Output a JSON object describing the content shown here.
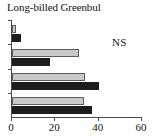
{
  "chart_data": {
    "type": "bar",
    "orientation": "horizontal",
    "title": "Long-billed Greenbul",
    "xlabel": "",
    "ylabel": "",
    "xlim": [
      0,
      60
    ],
    "xticks": [
      0,
      20,
      40,
      60
    ],
    "xtick_labels": [
      "0",
      "20",
      "40",
      "60"
    ],
    "grid": false,
    "legend": null,
    "annotations": [
      {
        "text": "NS",
        "meaning": "not significant"
      }
    ],
    "groups": [
      "1",
      "2",
      "3",
      "4"
    ],
    "series": [
      {
        "name": "light",
        "color": "#c9c9c9",
        "values": [
          2,
          31,
          33.5,
          33
        ]
      },
      {
        "name": "dark",
        "color": "#1c1c1c",
        "values": [
          4,
          17.5,
          40,
          37
        ]
      }
    ]
  },
  "figure": {
    "title": "Long-billed Greenbul",
    "ns_label": "NS"
  }
}
